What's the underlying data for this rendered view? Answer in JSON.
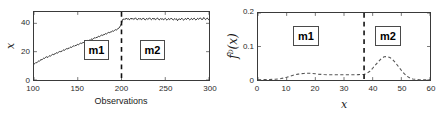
{
  "figure": {
    "panels": [
      {
        "id": "timeseries",
        "annotations": [
          {
            "label": "m1"
          },
          {
            "label": "m2"
          }
        ]
      },
      {
        "id": "density",
        "annotations": [
          {
            "label": "m1"
          },
          {
            "label": "m2"
          }
        ]
      }
    ]
  },
  "chart_data": [
    {
      "type": "line",
      "id": "timeseries",
      "title": "",
      "xlabel": "Observations",
      "ylabel": "x",
      "ylabel_math": "x",
      "xlim": [
        100,
        300
      ],
      "ylim": [
        0,
        48
      ],
      "xticks": [
        100,
        150,
        200,
        250,
        300
      ],
      "yticks": [
        0,
        20,
        40
      ],
      "xticklabels": [
        "100",
        "150",
        "200",
        "250",
        "300"
      ],
      "yticklabels": [
        "0",
        "20",
        "40"
      ],
      "grid": false,
      "legend": null,
      "line_color": "#000000",
      "annotations": [
        {
          "text": "m1",
          "x": 168,
          "y": 17,
          "type": "box-label"
        },
        {
          "text": "m2",
          "x": 232,
          "y": 17,
          "type": "box-label"
        },
        {
          "text": "changepoint",
          "x": 200,
          "type": "vline-dashed"
        }
      ],
      "series": [
        {
          "name": "x",
          "x": [
            100,
            101,
            102,
            103,
            104,
            105,
            106,
            107,
            108,
            109,
            110,
            111,
            112,
            113,
            114,
            115,
            116,
            117,
            118,
            119,
            120,
            121,
            122,
            123,
            124,
            125,
            126,
            127,
            128,
            129,
            130,
            131,
            132,
            133,
            134,
            135,
            136,
            137,
            138,
            139,
            140,
            141,
            142,
            143,
            144,
            145,
            146,
            147,
            148,
            149,
            150,
            151,
            152,
            153,
            154,
            155,
            156,
            157,
            158,
            159,
            160,
            161,
            162,
            163,
            164,
            165,
            166,
            167,
            168,
            169,
            170,
            171,
            172,
            173,
            174,
            175,
            176,
            177,
            178,
            179,
            180,
            181,
            182,
            183,
            184,
            185,
            186,
            187,
            188,
            189,
            190,
            191,
            192,
            193,
            194,
            195,
            196,
            197,
            198,
            199,
            200,
            201,
            202,
            203,
            204,
            205,
            206,
            207,
            208,
            209,
            210,
            211,
            212,
            213,
            214,
            215,
            216,
            217,
            218,
            219,
            220,
            221,
            222,
            223,
            224,
            225,
            226,
            227,
            228,
            229,
            230,
            231,
            232,
            233,
            234,
            235,
            236,
            237,
            238,
            239,
            240,
            241,
            242,
            243,
            244,
            245,
            246,
            247,
            248,
            249,
            250,
            251,
            252,
            253,
            254,
            255,
            256,
            257,
            258,
            259,
            260,
            261,
            262,
            263,
            264,
            265,
            266,
            267,
            268,
            269,
            270,
            271,
            272,
            273,
            274,
            275,
            276,
            277,
            278,
            279,
            280,
            281,
            282,
            283,
            284,
            285,
            286,
            287,
            288,
            289,
            290,
            291,
            292,
            293,
            294,
            295,
            296,
            297,
            298,
            299,
            300
          ],
          "values": [
            11.2,
            11.6,
            12.3,
            12.1,
            12.8,
            13.4,
            13.1,
            13.9,
            14.5,
            14.2,
            14.9,
            15.4,
            15.2,
            15.9,
            16.4,
            16.1,
            16.0,
            16.7,
            17.2,
            16.9,
            17.5,
            18.1,
            17.8,
            18.4,
            18.2,
            18.9,
            19.3,
            19.0,
            19.6,
            20.1,
            19.8,
            20.4,
            20.2,
            20.9,
            21.3,
            21.0,
            21.6,
            22.1,
            21.9,
            22.5,
            22.2,
            22.9,
            23.3,
            23.0,
            23.6,
            24.1,
            23.8,
            24.4,
            24.2,
            24.8,
            25.2,
            24.9,
            25.5,
            26.0,
            25.7,
            26.3,
            26.1,
            26.7,
            27.1,
            26.8,
            27.4,
            27.9,
            27.6,
            28.2,
            28.0,
            28.6,
            29.0,
            28.7,
            29.3,
            29.8,
            29.5,
            30.1,
            29.9,
            30.5,
            30.9,
            30.6,
            31.2,
            31.7,
            31.4,
            32.0,
            31.8,
            32.4,
            32.8,
            32.5,
            33.1,
            33.6,
            33.3,
            33.9,
            33.7,
            34.3,
            34.7,
            34.4,
            35.0,
            35.5,
            35.2,
            35.8,
            36.2,
            36.6,
            37.4,
            38.6,
            39.9,
            42.3,
            43.1,
            42.6,
            43.4,
            42.9,
            43.6,
            42.8,
            43.3,
            42.5,
            43.0,
            43.7,
            42.9,
            43.5,
            42.7,
            43.2,
            43.9,
            43.1,
            42.4,
            43.0,
            43.6,
            42.8,
            43.4,
            42.6,
            43.1,
            43.8,
            43.0,
            42.3,
            42.9,
            43.5,
            42.7,
            43.2,
            43.9,
            43.1,
            42.5,
            43.0,
            43.7,
            42.8,
            43.4,
            42.6,
            43.2,
            43.8,
            43.0,
            42.4,
            42.8,
            43.5,
            42.7,
            43.3,
            42.5,
            43.0,
            43.6,
            42.8,
            42.2,
            42.9,
            43.4,
            42.6,
            43.1,
            43.7,
            42.9,
            42.3,
            42.8,
            43.4,
            42.7,
            43.2,
            41.9,
            42.6,
            43.3,
            42.5,
            43.0,
            43.6,
            42.8,
            42.2,
            42.9,
            43.5,
            42.7,
            43.2,
            43.8,
            43.0,
            42.4,
            42.9,
            43.5,
            42.6,
            43.1,
            43.7,
            42.9,
            42.3,
            43.0,
            43.6,
            42.8,
            43.3,
            43.9,
            43.1,
            42.5,
            43.0,
            44.1,
            43.4,
            42.6,
            43.2,
            43.8,
            42.9,
            42.3,
            43.0,
            43.6,
            42.8,
            42.1,
            42.7,
            43.9
          ]
        }
      ]
    },
    {
      "type": "line",
      "id": "density",
      "title": "",
      "xlabel": "x",
      "ylabel": "f^D(x)",
      "ylabel_math": "f D ( x )",
      "xlim": [
        0,
        60
      ],
      "ylim": [
        0,
        0.2
      ],
      "xticks": [
        0,
        10,
        20,
        30,
        40,
        50,
        60
      ],
      "yticks": [
        0,
        0.1,
        0.2
      ],
      "xticklabels": [
        "0",
        "10",
        "20",
        "30",
        "40",
        "50",
        "60"
      ],
      "yticklabels": [
        "0",
        "0.1",
        "0.2"
      ],
      "grid": false,
      "legend": null,
      "line_style": "dashed",
      "line_color": "#555555",
      "annotations": [
        {
          "text": "m1",
          "x": 20,
          "y": 0.13,
          "type": "box-label"
        },
        {
          "text": "m2",
          "x": 48,
          "y": 0.13,
          "type": "box-label"
        },
        {
          "text": "threshold",
          "x": 37,
          "type": "vline-dashed"
        }
      ],
      "series": [
        {
          "name": "f^D(x)",
          "x": [
            0,
            1,
            2,
            3,
            4,
            5,
            6,
            7,
            8,
            9,
            10,
            11,
            12,
            13,
            14,
            15,
            16,
            17,
            18,
            19,
            20,
            21,
            22,
            23,
            24,
            25,
            26,
            27,
            28,
            29,
            30,
            31,
            32,
            33,
            34,
            35,
            36,
            37,
            38,
            39,
            40,
            41,
            42,
            43,
            44,
            45,
            46,
            47,
            48,
            49,
            50,
            51,
            52,
            53,
            54,
            55,
            56,
            57,
            58,
            59,
            60
          ],
          "values": [
            0.0008,
            0.001,
            0.0012,
            0.0014,
            0.0016,
            0.0018,
            0.0022,
            0.003,
            0.0042,
            0.006,
            0.0082,
            0.0108,
            0.0135,
            0.0158,
            0.0175,
            0.0188,
            0.0196,
            0.02,
            0.0199,
            0.0194,
            0.0186,
            0.0176,
            0.0168,
            0.0162,
            0.0158,
            0.0156,
            0.0155,
            0.0155,
            0.0155,
            0.0155,
            0.0155,
            0.0155,
            0.0156,
            0.0157,
            0.0158,
            0.016,
            0.0163,
            0.0168,
            0.0195,
            0.026,
            0.035,
            0.045,
            0.055,
            0.064,
            0.0692,
            0.07,
            0.0672,
            0.0605,
            0.051,
            0.04,
            0.029,
            0.019,
            0.011,
            0.0058,
            0.003,
            0.0018,
            0.0012,
            0.0009,
            0.0007,
            0.0006,
            0.0005
          ]
        }
      ]
    }
  ]
}
